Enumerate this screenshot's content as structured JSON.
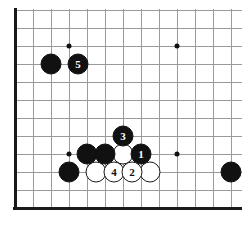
{
  "board": {
    "kind": "go-board-diagram",
    "grid": {
      "origin_x": 15,
      "origin_y": 10,
      "spacing": 18,
      "cols": 13,
      "rows": 12,
      "line_color": "#9a9a9a",
      "edge_color": "#1a1a1a"
    },
    "background_color": "#ffffff",
    "edges": [
      {
        "side": "left",
        "name": "board-edge-left"
      },
      {
        "side": "bottom",
        "name": "board-edge-bottom"
      }
    ],
    "star_points": [
      {
        "name": "star-point-upper-left",
        "col": 3,
        "row": 2
      },
      {
        "name": "star-point-upper-right",
        "col": 9,
        "row": 2
      },
      {
        "name": "star-point-lower-left",
        "col": 3,
        "row": 8
      },
      {
        "name": "star-point-lower-right",
        "col": 9,
        "row": 8
      }
    ],
    "stone_radius": 10.5,
    "stones": [
      {
        "name": "black-stone-upper-left-corner",
        "color": "black",
        "label": "",
        "col": 2,
        "row": 3
      },
      {
        "name": "black-stone-move-5",
        "color": "black",
        "label": "5",
        "col": 3.5,
        "row": 3
      },
      {
        "name": "black-stone-move-3",
        "color": "black",
        "label": "3",
        "col": 6,
        "row": 7
      },
      {
        "name": "black-stone-left-group-a",
        "color": "black",
        "label": "",
        "col": 4,
        "row": 8
      },
      {
        "name": "black-stone-left-group-b",
        "color": "black",
        "label": "",
        "col": 5,
        "row": 8
      },
      {
        "name": "white-stone-center",
        "color": "white",
        "label": "",
        "col": 6,
        "row": 8
      },
      {
        "name": "black-stone-move-1",
        "color": "black",
        "label": "1",
        "col": 7,
        "row": 8
      },
      {
        "name": "black-stone-lower-left",
        "color": "black",
        "label": "",
        "col": 3,
        "row": 9
      },
      {
        "name": "white-stone-bottom-a",
        "color": "white",
        "label": "",
        "col": 4.5,
        "row": 9
      },
      {
        "name": "white-stone-move-4",
        "color": "white",
        "label": "4",
        "col": 5.5,
        "row": 9
      },
      {
        "name": "white-stone-move-2",
        "color": "white",
        "label": "2",
        "col": 6.5,
        "row": 9
      },
      {
        "name": "white-stone-bottom-d",
        "color": "white",
        "label": "",
        "col": 7.5,
        "row": 9
      },
      {
        "name": "black-stone-right-side",
        "color": "black",
        "label": "",
        "col": 12,
        "row": 9
      }
    ]
  }
}
